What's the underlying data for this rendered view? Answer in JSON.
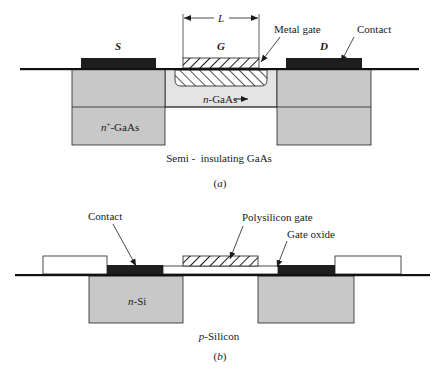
{
  "figure_a": {
    "dimension_label": "L",
    "terminal_source": "S",
    "terminal_gate": "G",
    "terminal_drain": "D",
    "label_metal_gate": "Metal gate",
    "label_contact": "Contact",
    "label_channel_prefix": "n",
    "label_channel_suffix": "-GaAs",
    "label_channel_arrow": "→",
    "label_nplus_prefix": "n",
    "label_nplus_sup": "+",
    "label_nplus_suffix": "-GaAs",
    "label_substrate": "Semi -  insulating GaAs",
    "caption_open": "(",
    "caption_letter": "a",
    "caption_close": ")"
  },
  "figure_b": {
    "label_contact": "Contact",
    "label_poly_gate": "Polysilicon gate",
    "label_gate_oxide": "Gate oxide",
    "label_nsi_prefix": "n",
    "label_nsi_suffix": "-Si",
    "label_substrate_prefix": "p",
    "label_substrate_suffix": "-Silicon",
    "caption_open": "(",
    "caption_letter": "b",
    "caption_close": ")"
  },
  "colors": {
    "contact": "#1e1e1e",
    "heavy_doped": "#c8c8c8",
    "channel": "#e4e4e4",
    "outline": "#222222",
    "oxide": "#ffffff"
  }
}
